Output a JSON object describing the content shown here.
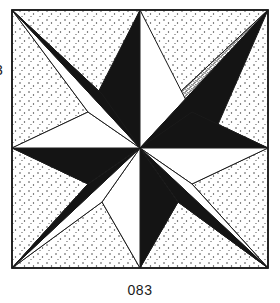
{
  "figure": {
    "caption": "083",
    "margin_mark": "3",
    "frame": {
      "x": 12,
      "y": 10,
      "width": 256,
      "height": 258,
      "stroke": "#1a1a1a",
      "stroke_width": 1.6
    },
    "colors": {
      "ink": "#1a1a1a",
      "paper": "#ffffff",
      "black_fill": "#141414",
      "stipple_dense": "#2b2b2b",
      "stipple_light": "#3a3a3a",
      "background_stipple": "#555555"
    },
    "center": {
      "x": 140,
      "y": 148
    },
    "star": {
      "points": 8,
      "tips": [
        {
          "name": "north",
          "x": 140,
          "y": 10,
          "left_half": "black",
          "right_half": "white"
        },
        {
          "name": "northeast",
          "x": 268,
          "y": 10,
          "left_half": "white",
          "right_half": "black"
        },
        {
          "name": "east",
          "x": 268,
          "y": 148,
          "left_half": "black",
          "right_half": "white"
        },
        {
          "name": "southeast",
          "x": 268,
          "y": 268,
          "left_half": "white",
          "right_half": "black"
        },
        {
          "name": "south",
          "x": 140,
          "y": 268,
          "left_half": "white",
          "right_half": "black"
        },
        {
          "name": "southwest",
          "x": 12,
          "y": 268,
          "left_half": "black",
          "right_half": "white"
        },
        {
          "name": "west",
          "x": 12,
          "y": 148,
          "left_half": "white",
          "right_half": "black"
        },
        {
          "name": "northwest",
          "x": 12,
          "y": 10,
          "left_half": "black",
          "right_half": "white"
        }
      ],
      "inner_radius": 52
    },
    "corner_fans": [
      {
        "corner": "top-left",
        "x": 12,
        "y": 10,
        "bands": [
          "light",
          "dense",
          "light"
        ]
      },
      {
        "corner": "top-right",
        "x": 268,
        "y": 10,
        "bands": [
          "light",
          "dense",
          "light"
        ]
      },
      {
        "corner": "bottom-left",
        "x": 12,
        "y": 268,
        "bands": [
          "light",
          "dense",
          "light"
        ]
      },
      {
        "corner": "bottom-right",
        "x": 268,
        "y": 268,
        "bands": [
          "light",
          "dense",
          "light"
        ]
      }
    ]
  }
}
